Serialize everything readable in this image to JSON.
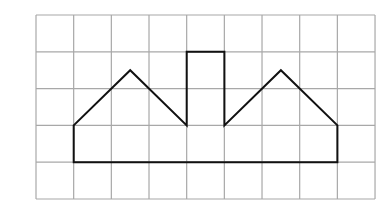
{
  "grid": {
    "columns": 9,
    "rows": 5,
    "origin": [
      36,
      15
    ],
    "cell_width": 37.67,
    "cell_height": 36.8,
    "line_color": "#a8a8a8"
  },
  "shape": {
    "stroke_color": "#111111",
    "vertices_grid_units": [
      [
        1,
        4
      ],
      [
        1,
        3
      ],
      [
        2.5,
        1.5
      ],
      [
        4,
        3
      ],
      [
        4,
        1
      ],
      [
        5,
        1
      ],
      [
        5,
        3
      ],
      [
        6.5,
        1.5
      ],
      [
        8,
        3
      ],
      [
        8,
        4
      ]
    ],
    "closed": true
  }
}
